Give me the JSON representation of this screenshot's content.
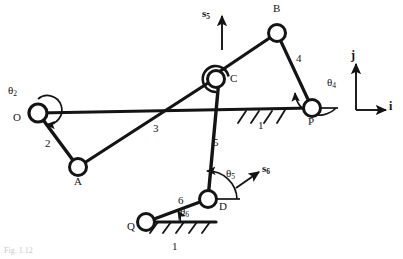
{
  "figure": {
    "caption": "Fig. 1.12",
    "background_color": "#ffffff",
    "stroke_color": "#141414"
  },
  "joints": [
    {
      "id": "O",
      "label": "O",
      "x": 38,
      "y": 113,
      "r": 9,
      "label_x": 13,
      "label_y": 118
    },
    {
      "id": "A",
      "label": "A",
      "x": 78,
      "y": 167,
      "r": 8.5,
      "label_x": 74,
      "label_y": 182
    },
    {
      "id": "C",
      "label": "C",
      "x": 216,
      "y": 79,
      "r": 8.5,
      "label_x": 230,
      "label_y": 78
    },
    {
      "id": "B",
      "label": "B",
      "x": 277,
      "y": 33,
      "r": 8.5,
      "label_x": 273,
      "label_y": 8
    },
    {
      "id": "P",
      "label": "P",
      "x": 312,
      "y": 108,
      "r": 8.5,
      "label_x": 308,
      "label_y": 121
    },
    {
      "id": "D",
      "label": "D",
      "x": 208,
      "y": 199,
      "r": 8.5,
      "label_x": 219,
      "label_y": 206
    },
    {
      "id": "Q",
      "label": "Q",
      "x": 146,
      "y": 222,
      "r": 8.5,
      "label_x": 128,
      "label_y": 226
    }
  ],
  "links": [
    {
      "id": "link2",
      "label": "2",
      "from": "O",
      "to": "A",
      "label_x": 45,
      "label_y": 143
    },
    {
      "id": "link3",
      "label": "3",
      "from": "A",
      "to": "C",
      "label_x": 153,
      "label_y": 128
    },
    {
      "id": "link4",
      "label": "4",
      "from": "B",
      "to": "P",
      "label_x": 296,
      "label_y": 58
    },
    {
      "id": "link5",
      "label": "5",
      "from": "C",
      "to": "D",
      "label_x": 213,
      "label_y": 142
    },
    {
      "id": "link6",
      "label": "6",
      "from": "Q",
      "to": "D",
      "label_x": 178,
      "label_y": 200
    },
    {
      "id": "linkCB",
      "label": "",
      "from": "C",
      "to": "B",
      "label_x": 0,
      "label_y": 0
    }
  ],
  "ground_links": [
    {
      "id": "ground-upper",
      "label": "1",
      "label_x": 258,
      "label_y": 125,
      "x1": 38,
      "y1": 113,
      "x2": 312,
      "y2": 108
    },
    {
      "id": "ground-lower",
      "label": "1",
      "label_x": 172,
      "label_y": 247,
      "x1": 146,
      "y1": 222,
      "x2": 215,
      "y2": 222
    }
  ],
  "angles": [
    {
      "id": "theta2",
      "symbol": "θ",
      "subscript": "2",
      "label_x": 10,
      "label_y": 92,
      "joint": "O"
    },
    {
      "id": "theta4",
      "symbol": "θ",
      "subscript": "4",
      "label_x": 327,
      "label_y": 83,
      "joint": "P"
    },
    {
      "id": "theta5",
      "symbol": "θ",
      "subscript": "5",
      "label_x": 227,
      "label_y": 174,
      "joint": "D"
    },
    {
      "id": "theta6",
      "symbol": "θ",
      "subscript": "6",
      "label_x": 180,
      "label_y": 211,
      "joint": "Q"
    }
  ],
  "slide_vectors": [
    {
      "id": "s5",
      "symbol": "s",
      "subscript": "5",
      "label_x": 203,
      "label_y": 8,
      "direction": "up",
      "joint": "C"
    },
    {
      "id": "s6",
      "symbol": "s",
      "subscript": "6",
      "label_x": 262,
      "label_y": 168,
      "direction": "up-right",
      "joint": "D"
    }
  ],
  "coordinate_frame": {
    "origin_x": 356,
    "origin_y": 110,
    "i_label": "i",
    "i_label_x": 389,
    "i_label_y": 105,
    "j_label": "j",
    "j_label_x": 351,
    "j_label_y": 53
  }
}
